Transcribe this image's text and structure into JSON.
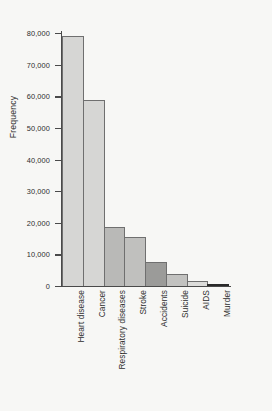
{
  "chart_data": {
    "type": "bar",
    "title": "",
    "xlabel": "",
    "ylabel": "Frequency",
    "categories": [
      "Heart disease",
      "Cancer",
      "Respiratory diseases",
      "Stroke",
      "Accidents",
      "Suicide",
      "AIDS",
      "Murder"
    ],
    "values": [
      79000,
      58800,
      18800,
      15500,
      7500,
      3800,
      1600,
      400
    ],
    "ylim": [
      0,
      80000
    ],
    "ytick_values": [
      0,
      10000,
      20000,
      30000,
      40000,
      50000,
      60000,
      70000,
      80000
    ],
    "ytick_labels": [
      "0",
      "10,000",
      "20,000",
      "30,000",
      "40,000",
      "50,000",
      "60,000",
      "70,000",
      "80,000"
    ],
    "grid": false,
    "legend": false,
    "legend_position": "none",
    "bar_colors": [
      "#d6d6d4",
      "#d6d6d4",
      "#b9b9b7",
      "#c0c0be",
      "#9b9b99",
      "#c2c2c0",
      "#dcdcda",
      "#2a2a2a"
    ],
    "bar_edge_color": "#6f6f6f",
    "axis_color": "#4a4a4a",
    "background_color": "#f7f7f5",
    "bar_widths_rel": [
      1,
      1,
      1,
      1,
      1,
      1,
      1,
      1
    ],
    "orientation": "vertical",
    "bars_contiguous": true,
    "xtick_label_rotation": -90
  }
}
